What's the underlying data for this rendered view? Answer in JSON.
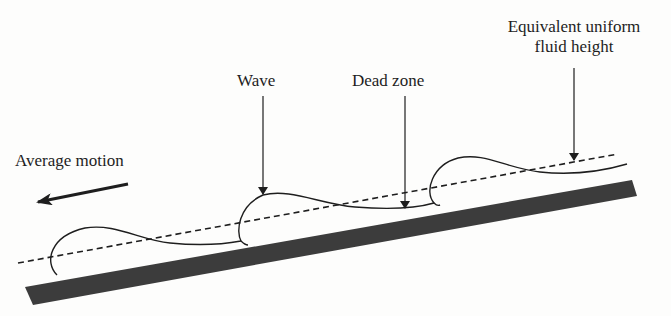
{
  "figure": {
    "labels": {
      "equivalent_line1": "Equivalent uniform",
      "equivalent_line2": "fluid height",
      "wave": "Wave",
      "dead_zone": "Dead zone",
      "average_motion": "Average motion"
    },
    "colors": {
      "ink": "#1e1e1e",
      "ground": "#3c3c3c",
      "background": "#fdfdfc"
    },
    "elements": [
      "inclined-ground-plane",
      "wave-profile",
      "equivalent-height-dashed-line",
      "average-motion-arrow"
    ]
  }
}
